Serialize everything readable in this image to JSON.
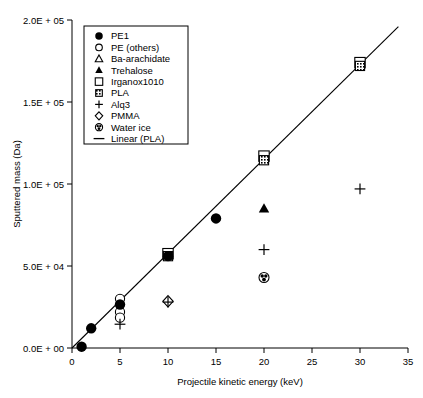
{
  "chart_data": {
    "type": "scatter",
    "title": "",
    "xlabel": "Projectile kinetic energy (keV)",
    "ylabel": "Sputtered mass (Da)",
    "xlim": [
      0,
      35
    ],
    "ylim": [
      0,
      200000
    ],
    "xticks": [
      0,
      5,
      10,
      15,
      20,
      25,
      30,
      35
    ],
    "xticklabels": [
      "0",
      "5",
      "10",
      "15",
      "20",
      "25",
      "30",
      "35"
    ],
    "yticks": [
      0,
      50000,
      100000,
      150000,
      200000
    ],
    "yticklabels": [
      "0.0E + 00",
      "5.0E + 04",
      "1.0E + 05",
      "1.5E + 05",
      "2.0E + 05"
    ],
    "grid": false,
    "legend_position": "upper-left",
    "series": [
      {
        "name": "PE1",
        "marker": "filled-circle",
        "points": [
          [
            1,
            800
          ],
          [
            2,
            12000
          ],
          [
            5,
            26500
          ],
          [
            10,
            56000
          ],
          [
            15,
            79000
          ]
        ]
      },
      {
        "name": "PE (others)",
        "marker": "open-circle",
        "points": [
          [
            5,
            30000
          ],
          [
            5,
            22000
          ],
          [
            5,
            18500
          ]
        ]
      },
      {
        "name": "Ba-arachidate",
        "marker": "open-triangle",
        "points": []
      },
      {
        "name": "Trehalose",
        "marker": "filled-triangle",
        "points": [
          [
            20,
            85000
          ]
        ]
      },
      {
        "name": "Irganox1010",
        "marker": "open-square",
        "points": [
          [
            10,
            57500
          ],
          [
            20,
            117000
          ],
          [
            30,
            174000
          ]
        ]
      },
      {
        "name": "PLA",
        "marker": "hatched-square",
        "points": [
          [
            10,
            56000
          ],
          [
            20,
            114500
          ],
          [
            30,
            172000
          ]
        ]
      },
      {
        "name": "Alq3",
        "marker": "plus",
        "points": [
          [
            5,
            14500
          ],
          [
            10,
            28000
          ],
          [
            20,
            60000
          ],
          [
            30,
            97000
          ]
        ]
      },
      {
        "name": "PMMA",
        "marker": "open-diamond",
        "points": [
          [
            10,
            28500
          ]
        ]
      },
      {
        "name": "Water ice",
        "marker": "circled-dot",
        "points": [
          [
            20,
            43000
          ]
        ]
      }
    ],
    "trendline": {
      "name": "Linear (PLA)",
      "marker": "line",
      "x0": 0,
      "y0": 0,
      "x1": 34,
      "y1": 196000
    }
  },
  "legend": {
    "items": [
      {
        "label": "PE1",
        "marker": "filled-circle"
      },
      {
        "label": "PE (others)",
        "marker": "open-circle"
      },
      {
        "label": "Ba-arachidate",
        "marker": "open-triangle"
      },
      {
        "label": "Trehalose",
        "marker": "filled-triangle"
      },
      {
        "label": "Irganox1010",
        "marker": "open-square"
      },
      {
        "label": "PLA",
        "marker": "hatched-square"
      },
      {
        "label": "Alq3",
        "marker": "plus"
      },
      {
        "label": "PMMA",
        "marker": "open-diamond"
      },
      {
        "label": "Water ice",
        "marker": "circled-dot"
      },
      {
        "label": "Linear (PLA)",
        "marker": "line"
      }
    ]
  },
  "colors": {
    "axis": "#000000",
    "marker": "#000000",
    "background": "#ffffff"
  }
}
